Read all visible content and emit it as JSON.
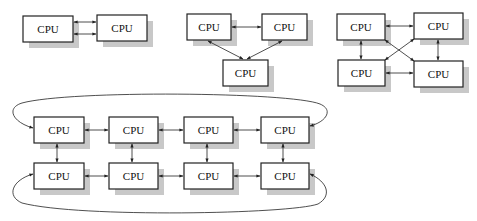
{
  "diagram": {
    "node_label": "CPU",
    "colors": {
      "box_border": "#222222",
      "shadow": "#c8c8c8",
      "background": "#ffffff"
    },
    "topologies": [
      {
        "name": "two-node-dual-link",
        "nodes": [
          {
            "id": "a",
            "label": "CPU",
            "x": 23,
            "y": 16,
            "w": 50,
            "h": 26
          },
          {
            "id": "b",
            "label": "CPU",
            "x": 97,
            "y": 15,
            "w": 50,
            "h": 26
          }
        ],
        "edges": [
          [
            "a",
            "b"
          ],
          [
            "a",
            "b"
          ]
        ]
      },
      {
        "name": "three-node-triangle",
        "nodes": [
          {
            "id": "tl",
            "label": "CPU",
            "x": 187,
            "y": 14,
            "w": 44,
            "h": 26
          },
          {
            "id": "tr",
            "label": "CPU",
            "x": 262,
            "y": 14,
            "w": 45,
            "h": 26
          },
          {
            "id": "b",
            "label": "CPU",
            "x": 223,
            "y": 60,
            "w": 45,
            "h": 26
          }
        ],
        "edges": [
          [
            "tl",
            "tr"
          ],
          [
            "tl",
            "b"
          ],
          [
            "tr",
            "b"
          ]
        ]
      },
      {
        "name": "four-node-fully-connected",
        "nodes": [
          {
            "id": "tl",
            "label": "CPU",
            "x": 337,
            "y": 14,
            "w": 48,
            "h": 26
          },
          {
            "id": "tr",
            "label": "CPU",
            "x": 414,
            "y": 13,
            "w": 49,
            "h": 26
          },
          {
            "id": "bl",
            "label": "CPU",
            "x": 338,
            "y": 60,
            "w": 47,
            "h": 26
          },
          {
            "id": "br",
            "label": "CPU",
            "x": 414,
            "y": 61,
            "w": 49,
            "h": 26
          }
        ],
        "edges": [
          [
            "tl",
            "tr"
          ],
          [
            "bl",
            "br"
          ],
          [
            "tl",
            "bl"
          ],
          [
            "tr",
            "br"
          ],
          [
            "tl",
            "br"
          ],
          [
            "tr",
            "bl"
          ]
        ]
      },
      {
        "name": "eight-node-torus",
        "rows": [
          [
            "CPU",
            "CPU",
            "CPU",
            "CPU"
          ],
          [
            "CPU",
            "CPU",
            "CPU",
            "CPU"
          ]
        ],
        "wraparound": "row ends connected by curved links"
      }
    ]
  }
}
